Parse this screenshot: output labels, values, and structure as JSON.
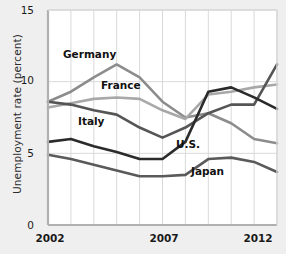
{
  "chart_data": {
    "type": "line",
    "title": "",
    "xlabel": "",
    "ylabel": "Unemployment rate (percent)",
    "xlim": [
      2002,
      2012
    ],
    "ylim": [
      0,
      15
    ],
    "yticks": [
      0,
      5,
      10,
      15
    ],
    "xticks": [
      2002,
      2007,
      2012
    ],
    "xtick_labels": [
      "2002",
      "2007",
      "2012"
    ],
    "ytick_labels": [
      "0",
      "5",
      "10",
      "15"
    ],
    "grid": true,
    "legend": "inline-labels",
    "x": [
      2002,
      2003,
      2004,
      2005,
      2006,
      2007,
      2008,
      2009,
      2010,
      2011,
      2012
    ],
    "series": [
      {
        "name": "Germany",
        "color": "#8c8c8c",
        "values": [
          8.6,
          9.3,
          10.3,
          11.2,
          10.3,
          8.6,
          7.5,
          7.8,
          7.1,
          6.0,
          5.7
        ]
      },
      {
        "name": "France",
        "color": "#a8a8a8",
        "values": [
          8.2,
          8.5,
          8.8,
          8.9,
          8.8,
          8.0,
          7.4,
          9.1,
          9.3,
          9.6,
          9.8
        ]
      },
      {
        "name": "Italy",
        "color": "#555555",
        "values": [
          8.6,
          8.4,
          8.0,
          7.7,
          6.8,
          6.1,
          6.8,
          7.8,
          8.4,
          8.4,
          11.2
        ]
      },
      {
        "name": "U.S.",
        "color": "#2b2b2b",
        "values": [
          5.8,
          6.0,
          5.5,
          5.1,
          4.6,
          4.6,
          5.8,
          9.3,
          9.6,
          8.9,
          8.1
        ]
      },
      {
        "name": "Japan",
        "color": "#5a5a5a",
        "values": [
          4.9,
          4.6,
          4.2,
          3.8,
          3.4,
          3.4,
          3.5,
          4.6,
          4.7,
          4.4,
          3.7
        ]
      }
    ],
    "series_labels": [
      {
        "name": "Germany",
        "x": 63,
        "y": 48
      },
      {
        "name": "France",
        "x": 101,
        "y": 79
      },
      {
        "name": "Italy",
        "x": 78,
        "y": 115
      },
      {
        "name": "U.S.",
        "x": 176,
        "y": 138
      },
      {
        "name": "Japan",
        "x": 191,
        "y": 165
      }
    ]
  }
}
